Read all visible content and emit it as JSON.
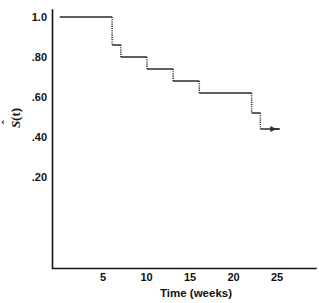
{
  "chart_data": {
    "type": "line",
    "subtype": "step-survival-curve",
    "title": "",
    "xlabel": "Time (weeks)",
    "ylabel": "Ŝ(t)",
    "xlim": [
      0,
      26
    ],
    "ylim": [
      0,
      1.05
    ],
    "xticks": [
      5,
      10,
      15,
      20,
      25
    ],
    "xtick_labels": [
      "5",
      "10",
      "15",
      "20",
      "25"
    ],
    "yticks": [
      0.2,
      0.4,
      0.6,
      0.8,
      1.0
    ],
    "ytick_labels": [
      ".20",
      ".40",
      ".60",
      ".80",
      "1.0"
    ],
    "grid": false,
    "legend": false,
    "series": [
      {
        "name": "Kaplan-Meier survival estimate",
        "step": "post",
        "x": [
          0,
          6,
          7,
          10,
          13,
          16,
          22,
          23
        ],
        "y": [
          1.0,
          0.86,
          0.8,
          0.74,
          0.68,
          0.62,
          0.52,
          0.44
        ],
        "segments": [
          {
            "t_start": 0,
            "t_end": 6,
            "s": 1.0
          },
          {
            "t_start": 6,
            "t_end": 7,
            "s": 0.86
          },
          {
            "t_start": 7,
            "t_end": 10,
            "s": 0.8
          },
          {
            "t_start": 10,
            "t_end": 13,
            "s": 0.74
          },
          {
            "t_start": 13,
            "t_end": 16,
            "s": 0.68
          },
          {
            "t_start": 16,
            "t_end": 22,
            "s": 0.62
          },
          {
            "t_start": 22,
            "t_end": 23,
            "s": 0.52
          },
          {
            "t_start": 23,
            "t_end": 25.2,
            "s": 0.44
          }
        ],
        "drops": [
          {
            "t": 6,
            "from": 1.0,
            "to": 0.86
          },
          {
            "t": 7,
            "from": 0.86,
            "to": 0.8
          },
          {
            "t": 10,
            "from": 0.8,
            "to": 0.74
          },
          {
            "t": 13,
            "from": 0.74,
            "to": 0.68
          },
          {
            "t": 16,
            "from": 0.68,
            "to": 0.62
          },
          {
            "t": 22,
            "from": 0.62,
            "to": 0.52
          },
          {
            "t": 23,
            "from": 0.52,
            "to": 0.44
          }
        ],
        "line_style_horizontal": "solid",
        "line_style_vertical": "dotted",
        "end_marker": "right-arrow",
        "color": "#2a2a2a"
      }
    ],
    "annotations": [
      {
        "name": "censoring-arrow",
        "t": 24.6,
        "s": 0.44,
        "direction": "right"
      }
    ]
  },
  "axes": {
    "x_tick_labels": [
      "5",
      "10",
      "15",
      "20",
      "25"
    ],
    "y_tick_labels": [
      "1.0",
      ".80",
      ".60",
      ".40",
      ".20"
    ],
    "x_axis_title": "Time (weeks)",
    "y_axis_title_base": "S",
    "y_axis_title_hat": "ˆ",
    "y_axis_title_suffix": "(t)"
  },
  "colors": {
    "background": "#ffffff",
    "axis": "#141414",
    "curve": "#2a2a2a",
    "text": "#121212"
  }
}
